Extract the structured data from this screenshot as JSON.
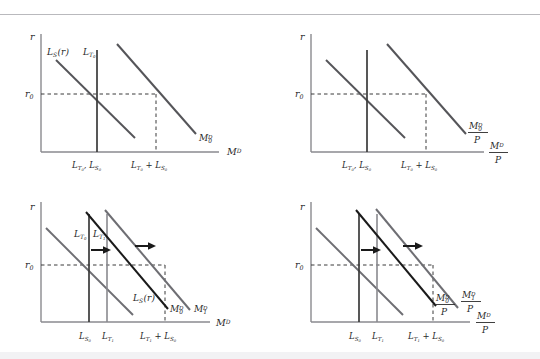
{
  "figure": {
    "type": "diagram",
    "panel_count": 4,
    "colors": {
      "axis": "#8a8a8f",
      "curve_dark": "#1a1a1a",
      "curve_gray": "#6e6e73",
      "dashed": "#3a3a3a",
      "rule": "#b9b9bd",
      "background": "#ffffff"
    }
  },
  "panels": [
    {
      "id": "panel-tl",
      "name": "nominal-money-demand-initial",
      "y_axis_label": "r",
      "x_axis_label": "M",
      "x_axis_label_sup": "D",
      "y_tick_label": "r",
      "y_tick_sub": "0",
      "curve_labels": [
        {
          "base": "L",
          "sub": "S",
          "paren": "(r)",
          "name": "speculative-demand-curve-label"
        },
        {
          "base": "L",
          "sub": "T",
          "sub2": "0",
          "name": "transactions-demand-line-label"
        },
        {
          "base": "M",
          "sub": "0",
          "sup": "D",
          "name": "total-money-demand-curve-label"
        }
      ],
      "x_tick_labels": [
        {
          "text": "L_{T_0}, L_{S_0}",
          "name": "x-tick-intersection-left"
        },
        {
          "text": "L_{T_0} + L_{S_0}",
          "name": "x-tick-intersection-right"
        }
      ],
      "arrows": []
    },
    {
      "id": "panel-tr",
      "name": "real-money-demand-initial",
      "y_axis_label": "r",
      "x_axis_label": "M",
      "x_axis_label_sup": "D",
      "x_axis_denominator": "P",
      "y_tick_label": "r",
      "y_tick_sub": "0",
      "curve_labels": [
        {
          "base": "M",
          "sub": "0",
          "sup": "D",
          "denominator": "P",
          "name": "real-money-demand-curve-label"
        }
      ],
      "x_tick_labels": [
        {
          "text": "L_{T_0}, L_{S_0}",
          "name": "x-tick-intersection-left"
        },
        {
          "text": "L_{T_0} + L_{S_0}",
          "name": "x-tick-intersection-right"
        }
      ],
      "arrows": []
    },
    {
      "id": "panel-bl",
      "name": "nominal-money-demand-shift",
      "y_axis_label": "r",
      "x_axis_label": "M",
      "x_axis_label_sup": "D",
      "y_tick_label": "r",
      "y_tick_sub": "0",
      "curve_labels": [
        {
          "base": "L",
          "sub": "T",
          "sub2": "0",
          "name": "transactions-line-0-label"
        },
        {
          "base": "L",
          "sub": "T",
          "sub2": "1",
          "name": "transactions-line-1-label"
        },
        {
          "base": "L",
          "sub": "S",
          "paren": "(r)",
          "name": "speculative-demand-curve-label"
        },
        {
          "base": "M",
          "sub": "0",
          "sup": "D",
          "name": "money-demand-0-label"
        },
        {
          "base": "M",
          "sub": "1",
          "sup": "D",
          "name": "money-demand-1-label"
        }
      ],
      "x_tick_labels": [
        {
          "text": "L_{S_0}",
          "name": "x-tick-ls0"
        },
        {
          "text": "L_{T_1}",
          "name": "x-tick-lt1"
        },
        {
          "text": "L_{T_1} + L_{S_0}",
          "name": "x-tick-sum"
        }
      ],
      "arrows": [
        {
          "name": "shift-arrow-transactions",
          "direction": "right"
        },
        {
          "name": "shift-arrow-demand",
          "direction": "right"
        }
      ]
    },
    {
      "id": "panel-br",
      "name": "real-money-demand-shift",
      "y_axis_label": "r",
      "x_axis_label": "M",
      "x_axis_label_sup": "D",
      "x_axis_denominator": "P",
      "y_tick_label": "r",
      "y_tick_sub": "0",
      "curve_labels": [
        {
          "base": "M",
          "sub": "0",
          "sup": "D",
          "denominator": "P",
          "name": "real-money-demand-0-label"
        },
        {
          "base": "M",
          "sub": "1",
          "sup": "D",
          "denominator": "P",
          "name": "real-money-demand-1-label"
        }
      ],
      "x_tick_labels": [
        {
          "text": "L_{S_0}",
          "name": "x-tick-ls0"
        },
        {
          "text": "L_{T_1}",
          "name": "x-tick-lt1"
        },
        {
          "text": "L_{T_1} + L_{S_0}",
          "name": "x-tick-sum"
        }
      ],
      "arrows": [
        {
          "name": "shift-arrow-transactions",
          "direction": "right"
        },
        {
          "name": "shift-arrow-demand",
          "direction": "right"
        }
      ]
    }
  ],
  "labels": {
    "r": "r",
    "r0_base": "r",
    "r0_sub": "0",
    "M": "M",
    "D": "D",
    "P": "P",
    "L": "L",
    "S": "S",
    "T": "T",
    "zero": "0",
    "one": "1",
    "paren_r": "(r)",
    "comma": ",",
    "plus": "+"
  }
}
